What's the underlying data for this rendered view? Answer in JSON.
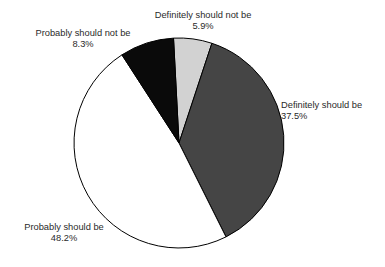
{
  "chart": {
    "title": "",
    "type": "pie"
  },
  "chart_data": {
    "type": "pie",
    "title": "",
    "subtitle": "",
    "xlabel": "",
    "ylabel": "",
    "legend_position": "none",
    "grid": false,
    "labels_position": "outside-callout",
    "units": "percent",
    "total": 99.9,
    "start_angle_deg": -3,
    "direction": "clockwise",
    "center": {
      "x": 179,
      "y": 143
    },
    "radius": 105,
    "slices": [
      {
        "name": "Definitely should not be",
        "label": "Definitely should not be",
        "value": 5.9,
        "display_value": "5.9%",
        "color": "#d2d2d2",
        "outline": "#000000"
      },
      {
        "name": "Definitely should be",
        "label": "Definitely should be",
        "value": 37.5,
        "display_value": "37.5%",
        "color": "#454545",
        "outline": "#000000"
      },
      {
        "name": "Probably should be",
        "label": "Probably should be",
        "value": 48.2,
        "display_value": "48.2%",
        "color": "#ffffff",
        "outline": "#000000"
      },
      {
        "name": "Probably should not be",
        "label": "Probably should not be",
        "value": 8.3,
        "display_value": "8.3%",
        "color": "#0a0a0a",
        "outline": "#000000"
      }
    ],
    "categories": [
      "Definitely should be",
      "Probably should be",
      "Probably should not be",
      "Definitely should not be"
    ],
    "values": [
      37.5,
      48.2,
      8.3,
      5.9
    ]
  },
  "labels": {
    "definitely_not": {
      "text": "Definitely should not be",
      "pct": "5.9%"
    },
    "probably_not": {
      "text": "Probably should not be",
      "pct": "8.3%"
    },
    "definitely": {
      "text": "Definitely should be",
      "pct": "37.5%"
    },
    "probably": {
      "text": "Probably should be",
      "pct": "48.2%"
    }
  }
}
